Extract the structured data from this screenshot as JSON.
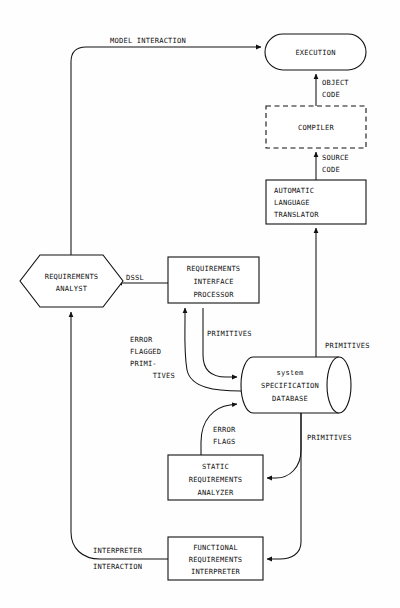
{
  "diagram": {
    "type": "flow-diagram",
    "background_color": "#ffffff",
    "line_color": "#111111",
    "nodes": [
      {
        "id": "execution",
        "shape": "stadium",
        "lines": [
          "EXECUTION"
        ],
        "x": 265,
        "y": 34,
        "w": 101,
        "h": 36
      },
      {
        "id": "compiler",
        "shape": "dashed-rect",
        "lines": [
          "COMPILER"
        ],
        "x": 266,
        "y": 106,
        "w": 100,
        "h": 42
      },
      {
        "id": "automatic-language-translator",
        "shape": "rect",
        "align": "left",
        "lines": [
          "AUTOMATIC",
          "LANGUAGE",
          "TRANSLATOR"
        ],
        "x": 266,
        "y": 180,
        "w": 100,
        "h": 44
      },
      {
        "id": "requirements-analyst",
        "shape": "hexagon",
        "lines": [
          "REQUIREMENTS",
          "ANALYST"
        ],
        "x": 20,
        "y": 255,
        "w": 103,
        "h": 52
      },
      {
        "id": "requirements-interface-processor",
        "shape": "rect",
        "lines": [
          "REQUIREMENTS",
          "INTERFACE",
          "PROCESSOR"
        ],
        "x": 168,
        "y": 257,
        "w": 91,
        "h": 46
      },
      {
        "id": "system-specification-database",
        "shape": "cylinder",
        "lines": [
          "system",
          "SPECIFICATION",
          "DATABASE"
        ],
        "x": 241,
        "y": 357,
        "w": 110,
        "h": 56
      },
      {
        "id": "static-requirements-analyzer",
        "shape": "rect",
        "lines": [
          "STATIC",
          "REQUIREMENTS",
          "ANALYZER"
        ],
        "x": 168,
        "y": 455,
        "w": 95,
        "h": 45
      },
      {
        "id": "functional-requirements-interpreter",
        "shape": "rect",
        "lines": [
          "FUNCTIONAL",
          "REQUIREMENTS",
          "INTERPRETER"
        ],
        "x": 168,
        "y": 537,
        "w": 95,
        "h": 43
      }
    ],
    "edge_labels": [
      {
        "id": "model-interaction",
        "lines": [
          "MODEL INTERACTION"
        ],
        "x": 110,
        "y": 43,
        "align": "start"
      },
      {
        "id": "object-code",
        "lines": [
          "OBJECT",
          "CODE"
        ],
        "x": 322,
        "y": 82,
        "align": "start"
      },
      {
        "id": "source-code",
        "lines": [
          "SOURCE",
          "CODE"
        ],
        "x": 322,
        "y": 157,
        "align": "start"
      },
      {
        "id": "dssl",
        "lines": [
          "DSSL"
        ],
        "x": 124,
        "y": 277,
        "align": "start"
      },
      {
        "id": "error-flagged-primitives",
        "lines": [
          "ERROR",
          "FLAGGED",
          "PRIMI-",
          "TIVES"
        ],
        "x": 130,
        "y": 342,
        "align": "mixed"
      },
      {
        "id": "primitives-to-rip",
        "lines": [
          "PRIMITIVES"
        ],
        "x": 204,
        "y": 336,
        "align": "start"
      },
      {
        "id": "primitives-to-translator",
        "lines": [
          "PRIMITIVES"
        ],
        "x": 327,
        "y": 352,
        "align": "start"
      },
      {
        "id": "error-flags",
        "lines": [
          "ERROR",
          "FLAGS"
        ],
        "x": 211,
        "y": 432,
        "align": "start"
      },
      {
        "id": "primitives-to-analyzer",
        "lines": [
          "PRIMITIVES"
        ],
        "x": 307,
        "y": 440,
        "align": "start"
      },
      {
        "id": "interpreter-interaction",
        "lines": [
          "INTERPRETER",
          "INTERACTION"
        ],
        "x": 93,
        "y": 553,
        "align": "start"
      }
    ],
    "edges": [
      {
        "id": "analyst-to-execution",
        "from": "requirements-analyst",
        "to": "execution",
        "label": "MODEL INTERACTION"
      },
      {
        "id": "compiler-to-execution",
        "from": "compiler",
        "to": "execution",
        "label": "OBJECT CODE"
      },
      {
        "id": "translator-to-compiler",
        "from": "automatic-language-translator",
        "to": "compiler",
        "label": "SOURCE CODE"
      },
      {
        "id": "database-to-translator",
        "from": "system-specification-database",
        "to": "automatic-language-translator",
        "label": "PRIMITIVES"
      },
      {
        "id": "rip-to-analyst",
        "from": "requirements-interface-processor",
        "to": "requirements-analyst",
        "label": "DSSL"
      },
      {
        "id": "database-to-rip-errorflagged",
        "from": "system-specification-database",
        "to": "requirements-interface-processor",
        "label": "ERROR FLAGGED PRIMITIVES"
      },
      {
        "id": "rip-to-database-primitives",
        "from": "requirements-interface-processor",
        "to": "system-specification-database",
        "label": "PRIMITIVES"
      },
      {
        "id": "analyzer-to-database-errorflags",
        "from": "static-requirements-analyzer",
        "to": "system-specification-database",
        "label": "ERROR FLAGS"
      },
      {
        "id": "database-to-analyzer-primitives",
        "from": "system-specification-database",
        "to": "static-requirements-analyzer",
        "label": "PRIMITIVES"
      },
      {
        "id": "database-to-interpreter",
        "from": "system-specification-database",
        "to": "functional-requirements-interpreter",
        "label": "PRIMITIVES"
      },
      {
        "id": "interpreter-to-analyst",
        "from": "functional-requirements-interpreter",
        "to": "requirements-analyst",
        "label": "INTERPRETER INTERACTION"
      }
    ]
  }
}
